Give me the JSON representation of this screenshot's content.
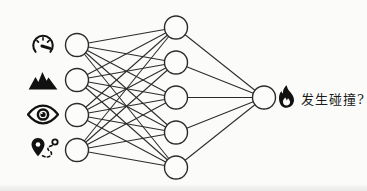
{
  "figure": {
    "type": "neural-network-diagram"
  },
  "network": {
    "layers": [
      4,
      5,
      1
    ]
  },
  "inputs": [
    {
      "icon": "speedometer-icon"
    },
    {
      "icon": "mountains-icon"
    },
    {
      "icon": "eye-icon"
    },
    {
      "icon": "route-icon"
    }
  ],
  "output": {
    "icon": "flame-icon",
    "label": "发生碰撞?"
  },
  "colors": {
    "stroke": "#2b2b2b",
    "node_fill": "#fcfcfb",
    "icon": "#111111",
    "text": "#1c1c1c",
    "background": "#fbfbf9"
  }
}
